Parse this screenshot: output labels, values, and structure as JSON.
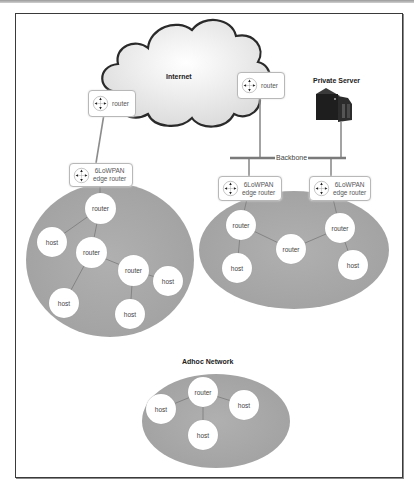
{
  "diagram": {
    "cloud": {
      "label": "Internet"
    },
    "internet_routers": [
      {
        "label": "router"
      },
      {
        "label": "router"
      }
    ],
    "private_server": {
      "label": "Private Server"
    },
    "backbone": {
      "label": "Backbone"
    },
    "edge_routers": [
      {
        "line1": "6LoWPAN",
        "line2": "edge router"
      },
      {
        "line1": "6LoWPAN",
        "line2": "edge router"
      },
      {
        "line1": "6LoWPAN",
        "line2": "edge router"
      }
    ],
    "network_left": {
      "nodes": [
        {
          "label": "router"
        },
        {
          "label": "host"
        },
        {
          "label": "router"
        },
        {
          "label": "router"
        },
        {
          "label": "host"
        },
        {
          "label": "host"
        },
        {
          "label": "host"
        }
      ]
    },
    "network_right": {
      "nodes": [
        {
          "label": "router"
        },
        {
          "label": "host"
        },
        {
          "label": "router"
        },
        {
          "label": "router"
        },
        {
          "label": "host"
        }
      ]
    },
    "network_adhoc": {
      "title": "Adhoc Network",
      "nodes": [
        {
          "label": "router"
        },
        {
          "label": "host"
        },
        {
          "label": "host"
        },
        {
          "label": "host"
        }
      ]
    },
    "colors": {
      "network_fill": "#a9a9a9",
      "link": "#8c8c8c",
      "cloud_stroke": "#2a2a2a",
      "frame": "#3a3a3a"
    }
  }
}
